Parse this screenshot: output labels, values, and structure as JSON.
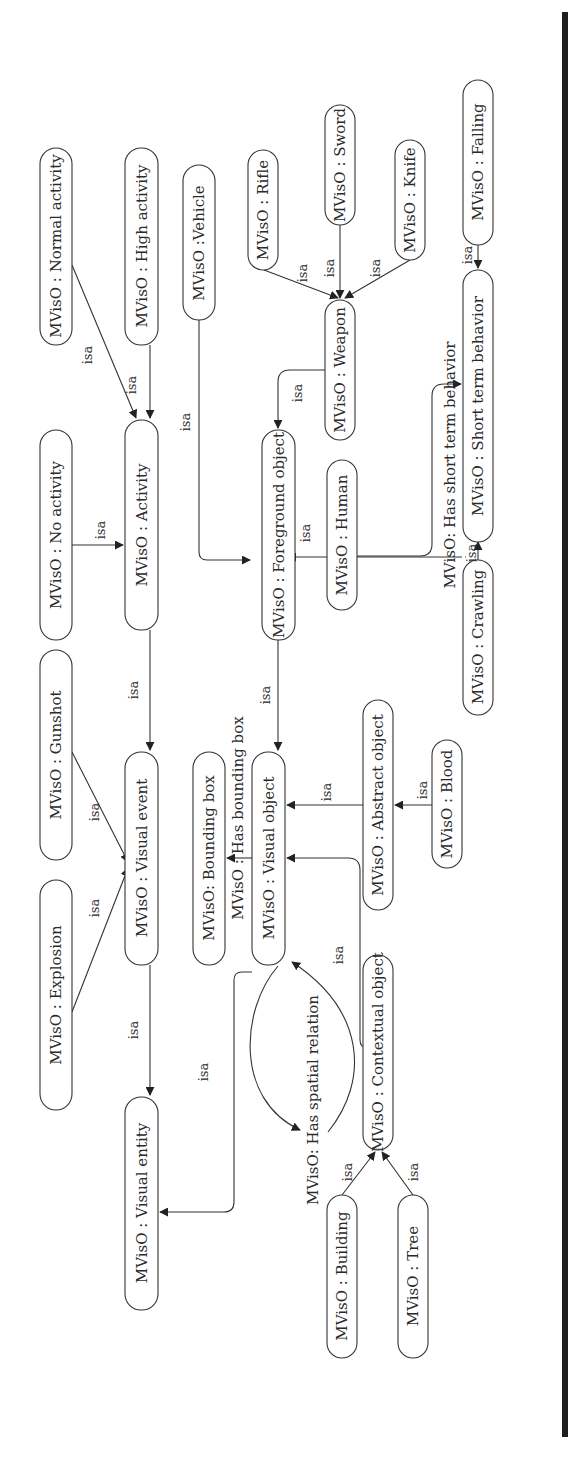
{
  "diagram": {
    "orientation": "rotated 90 degrees counter-clockwise",
    "edge_label": "isa",
    "nodes": {
      "normal_activity": "MVisO : Normal activity",
      "high_activity": "MVisO : High activity",
      "no_activity": "MVisO : No activity",
      "activity": "MVisO : Activity",
      "vehicle": "MVisO :Vehicle",
      "gunshot": "MVisO : Gunshot",
      "explosion": "MVisO : Explosion",
      "visual_event": "MVisO : Visual event",
      "visual_entity": "MVisO : Visual entity",
      "bounding_box": "MVisO: Bounding box",
      "visual_object": "MVisO : Visual object",
      "foreground_object": "MVisO : Foreground object",
      "rifle": "MVisO : Rifle",
      "sword": "MVisO : Sword",
      "knife": "MVisO : Knife",
      "weapon": "MVisO : Weapon",
      "human": "MVisO : Human",
      "abstract_object": "MVisO : Abstract object",
      "blood": "MVisO : Blood",
      "contextual_object": "MVisO : Contextual object",
      "building": "MVisO : Building",
      "tree": "MVisO : Tree",
      "falling": "MVisO : Falling",
      "short_term_behavior": "MVisO : Short term behavior",
      "crawling": "MVisO : Crawling"
    },
    "relations": {
      "has_bounding_box": "MVisO : Has bounding box",
      "has_spatial_relation": "MVisO: Has spatial relation",
      "has_short_term_behavior": "MVisO: Has short term behavior"
    },
    "edges": [
      {
        "from": "normal_activity",
        "to": "activity",
        "label": "isa"
      },
      {
        "from": "high_activity",
        "to": "activity",
        "label": "isa"
      },
      {
        "from": "no_activity",
        "to": "activity",
        "label": "isa"
      },
      {
        "from": "activity",
        "to": "visual_event",
        "label": "isa"
      },
      {
        "from": "gunshot",
        "to": "visual_event",
        "label": "isa"
      },
      {
        "from": "explosion",
        "to": "visual_event",
        "label": "isa"
      },
      {
        "from": "visual_event",
        "to": "visual_entity",
        "label": "isa"
      },
      {
        "from": "visual_object",
        "to": "visual_entity",
        "label": "isa"
      },
      {
        "from": "visual_object",
        "to": "bounding_box",
        "label": "MVisO : Has bounding box"
      },
      {
        "from": "visual_object",
        "to": "visual_object",
        "label": "MVisO: Has spatial relation"
      },
      {
        "from": "foreground_object",
        "to": "visual_object",
        "label": "isa"
      },
      {
        "from": "abstract_object",
        "to": "visual_object",
        "label": "isa"
      },
      {
        "from": "contextual_object",
        "to": "visual_object",
        "label": "isa"
      },
      {
        "from": "vehicle",
        "to": "foreground_object",
        "label": "isa"
      },
      {
        "from": "weapon",
        "to": "foreground_object",
        "label": "isa"
      },
      {
        "from": "human",
        "to": "foreground_object",
        "label": "isa"
      },
      {
        "from": "rifle",
        "to": "weapon",
        "label": "isa"
      },
      {
        "from": "sword",
        "to": "weapon",
        "label": "isa"
      },
      {
        "from": "knife",
        "to": "weapon",
        "label": "isa"
      },
      {
        "from": "blood",
        "to": "abstract_object",
        "label": "isa"
      },
      {
        "from": "building",
        "to": "contextual_object",
        "label": "isa"
      },
      {
        "from": "tree",
        "to": "contextual_object",
        "label": "isa"
      },
      {
        "from": "human",
        "to": "short_term_behavior",
        "label": "MVisO: Has short term behavior"
      },
      {
        "from": "falling",
        "to": "short_term_behavior",
        "label": "isa"
      },
      {
        "from": "crawling",
        "to": "short_term_behavior",
        "label": "isa"
      }
    ]
  }
}
